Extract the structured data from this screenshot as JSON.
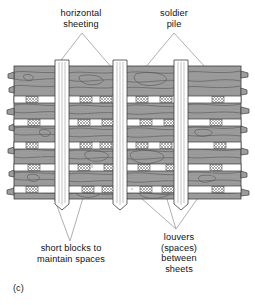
{
  "figure": {
    "caption": "(c)",
    "labels": {
      "horizontal_sheeting": "horizontal\nsheeting",
      "soldier_pile": "soldier\npile",
      "short_blocks": "short blocks to\nmaintain spaces",
      "louvers": "louvers\n(spaces)\nbetween\nsheets"
    },
    "colors": {
      "wood_fill": "#9a9a9a",
      "wood_grain": "#555555",
      "outline": "#3a3a3a",
      "gap_fill": "#ffffff",
      "block_hatch": "#7a7a7a",
      "pile_fill": "#ffffff",
      "leader_line": "#8d8d8d",
      "background": "#ffffff",
      "text": "#111111"
    },
    "structure": {
      "bays": 4,
      "soldier_piles": 3,
      "louver_rows": 5,
      "panel_top": 66,
      "panel_bottom": 199,
      "panel_left": 14,
      "panel_right": 241,
      "bay_x": [
        14,
        68,
        124,
        186,
        241
      ],
      "pile_x": [
        55,
        113,
        174
      ],
      "pile_width": 14,
      "louver_y": [
        96,
        119,
        142,
        164,
        186
      ],
      "louver_height": 7
    }
  }
}
